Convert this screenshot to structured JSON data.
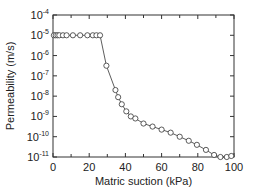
{
  "chart_data": {
    "type": "line",
    "title": "",
    "xlabel": "Matric suction (kPa)",
    "ylabel": "Permeability (m/s)",
    "xlim": [
      0,
      100
    ],
    "ylim": [
      1e-11,
      0.0001
    ],
    "yscale": "log",
    "grid": false,
    "legend": null,
    "x_ticks": [
      0,
      20,
      40,
      60,
      80,
      100
    ],
    "y_ticks": [
      {
        "exp": -4,
        "label": "10",
        "sup": "-4"
      },
      {
        "exp": -5,
        "label": "10",
        "sup": "-5"
      },
      {
        "exp": -6,
        "label": "10",
        "sup": "-6"
      },
      {
        "exp": -7,
        "label": "10",
        "sup": "-7"
      },
      {
        "exp": -8,
        "label": "10",
        "sup": "-8"
      },
      {
        "exp": -9,
        "label": "10",
        "sup": "-9"
      },
      {
        "exp": -10,
        "label": "10",
        "sup": "-10"
      },
      {
        "exp": -11,
        "label": "10",
        "sup": "-11"
      }
    ],
    "series": [
      {
        "name": "Permeability",
        "marker": "open-circle",
        "color": "#333333",
        "x": [
          0.5,
          1.5,
          2.5,
          3.5,
          5.5,
          7.5,
          11,
          15,
          19,
          22,
          24,
          26,
          29.5,
          34.5,
          36,
          38,
          40.5,
          43,
          45.5,
          50,
          55,
          60,
          65,
          70,
          75,
          79.5,
          84.5,
          89,
          92.5,
          96,
          98.5
        ],
        "log10_y": [
          -5,
          -5,
          -5,
          -5,
          -5,
          -5,
          -5,
          -5,
          -5,
          -5,
          -5,
          -5,
          -6.5,
          -7.7,
          -8.05,
          -8.4,
          -8.75,
          -9.0,
          -9.1,
          -9.35,
          -9.5,
          -9.65,
          -9.8,
          -10.0,
          -10.2,
          -10.4,
          -10.65,
          -10.9,
          -11.0,
          -11.0,
          -10.95
        ]
      }
    ]
  }
}
